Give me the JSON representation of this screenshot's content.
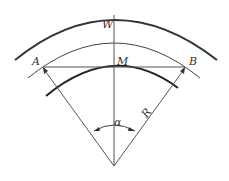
{
  "diagram": {
    "labels": {
      "W": "W",
      "A": "A",
      "M": "M",
      "B": "B",
      "R": "R",
      "alpha": "α"
    },
    "colors": {
      "stroke": "#333333",
      "background": "#ffffff"
    }
  }
}
